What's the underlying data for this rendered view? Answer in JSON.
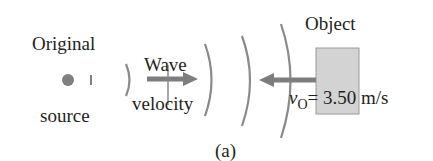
{
  "labels": {
    "source_top": "Original",
    "source_bottom": "source",
    "wave_top": "Wave",
    "wave_bottom": "velocity",
    "object": "Object",
    "velocity_symbol": "v",
    "velocity_subscript": "O",
    "velocity_value": "= 3.50 m/s",
    "panel": "(a)"
  },
  "colors": {
    "text": "#231f20",
    "arc": "#8a8a8a",
    "arrow": "#7d7d7d",
    "source_dot": "#808080",
    "object_fill": "#d3d3d3",
    "object_border": "#9a9a9a"
  }
}
